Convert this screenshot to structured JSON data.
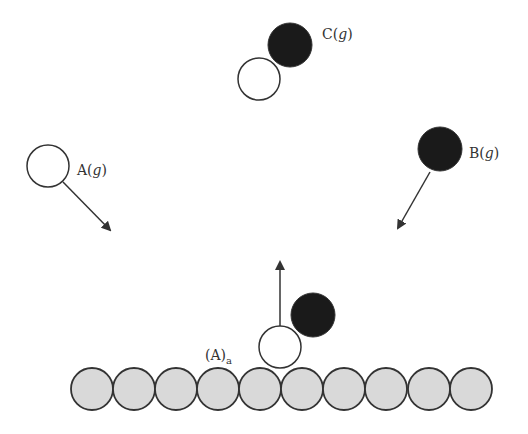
{
  "diagram": {
    "title": "",
    "colors": {
      "background": "#ffffff",
      "stroke": "#333333",
      "filled_atom": "#1a1a1a",
      "open_atom": "#ffffff",
      "surface_atom": "#d9d9d9",
      "arrow": "#333333"
    },
    "labels": {
      "c_molecule": {
        "main": "C(",
        "italic": "g",
        "end": ")"
      },
      "a_gas": {
        "main": "A(",
        "italic": "g",
        "end": ")"
      },
      "b_gas": {
        "main": "B(",
        "italic": "g",
        "end": ")"
      },
      "a_adsorbed": {
        "main": "(A)",
        "sub": "a"
      }
    },
    "surface": {
      "atom_count": 10,
      "atoms": [
        {
          "cx": 92,
          "cy": 389,
          "r": 21
        },
        {
          "cx": 134,
          "cy": 389,
          "r": 21
        },
        {
          "cx": 176,
          "cy": 389,
          "r": 21
        },
        {
          "cx": 218,
          "cy": 389,
          "r": 21
        },
        {
          "cx": 260,
          "cy": 389,
          "r": 21
        },
        {
          "cx": 302,
          "cy": 389,
          "r": 21
        },
        {
          "cx": 344,
          "cy": 389,
          "r": 21
        },
        {
          "cx": 386,
          "cy": 389,
          "r": 21
        },
        {
          "cx": 429,
          "cy": 389,
          "r": 21
        },
        {
          "cx": 471,
          "cy": 389,
          "r": 21
        }
      ]
    },
    "particles": {
      "c_black": {
        "cx": 290,
        "cy": 45,
        "r": 22,
        "fill": "filled"
      },
      "c_white": {
        "cx": 259,
        "cy": 79,
        "r": 21,
        "fill": "open"
      },
      "a_gas": {
        "cx": 48,
        "cy": 166,
        "r": 21,
        "fill": "open"
      },
      "b_gas": {
        "cx": 440,
        "cy": 149,
        "r": 22,
        "fill": "filled"
      },
      "a_adsorbed": {
        "cx": 280,
        "cy": 347,
        "r": 21,
        "fill": "open"
      },
      "b_reacting": {
        "cx": 313,
        "cy": 315,
        "r": 22,
        "fill": "filled"
      }
    },
    "arrows": {
      "a_to_surface": {
        "x1": 63,
        "y1": 182,
        "x2": 110,
        "y2": 230
      },
      "b_to_surface": {
        "x1": 430,
        "y1": 172,
        "x2": 398,
        "y2": 228
      },
      "desorption": {
        "x1": 280,
        "y1": 326,
        "x2": 280,
        "y2": 262
      }
    }
  }
}
